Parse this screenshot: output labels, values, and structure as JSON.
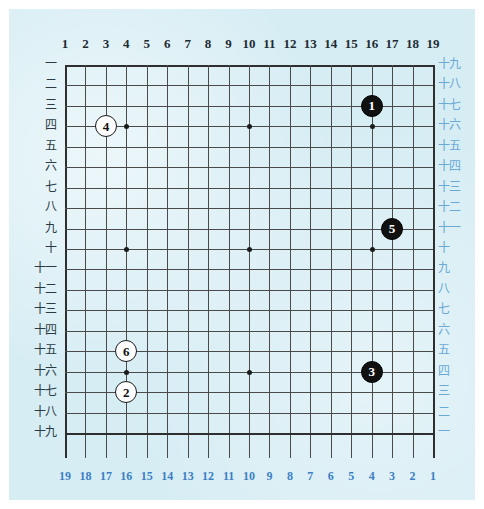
{
  "diagram": {
    "board_size": 19,
    "colors": {
      "paper": "#d6edf4",
      "grid_line": "#4a4a4a",
      "top_label": "#1f2b33",
      "bottom_label": "#3c7fc4",
      "left_label": "#2a3b44",
      "right_label": "#6aa9d4",
      "black_stone": "#111111",
      "white_stone": "#fdfdfd"
    }
  },
  "labels": {
    "top": [
      "1",
      "2",
      "3",
      "4",
      "5",
      "6",
      "7",
      "8",
      "9",
      "10",
      "11",
      "12",
      "13",
      "14",
      "15",
      "16",
      "17",
      "18",
      "19"
    ],
    "bottom": [
      "19",
      "18",
      "17",
      "16",
      "15",
      "14",
      "13",
      "12",
      "11",
      "10",
      "9",
      "8",
      "7",
      "6",
      "5",
      "4",
      "3",
      "2",
      "1"
    ],
    "left": [
      "一",
      "二",
      "三",
      "四",
      "五",
      "六",
      "七",
      "八",
      "九",
      "十",
      "十一",
      "十二",
      "十三",
      "十四",
      "十五",
      "十六",
      "十七",
      "十八",
      "十九"
    ],
    "right": [
      "十九",
      "十八",
      "十七",
      "十六",
      "十五",
      "十四",
      "十三",
      "十二",
      "十一",
      "十",
      "九",
      "八",
      "七",
      "六",
      "五",
      "四",
      "三",
      "二",
      "一"
    ]
  },
  "star_points": [
    {
      "col": 4,
      "row": 4
    },
    {
      "col": 10,
      "row": 4
    },
    {
      "col": 16,
      "row": 4
    },
    {
      "col": 4,
      "row": 10
    },
    {
      "col": 10,
      "row": 10
    },
    {
      "col": 16,
      "row": 10
    },
    {
      "col": 4,
      "row": 16
    },
    {
      "col": 10,
      "row": 16
    },
    {
      "col": 16,
      "row": 16
    }
  ],
  "stones": [
    {
      "number": "1",
      "color": "black",
      "col": 16,
      "row": 3
    },
    {
      "number": "2",
      "color": "white",
      "col": 4,
      "row": 17
    },
    {
      "number": "3",
      "color": "black",
      "col": 16,
      "row": 16
    },
    {
      "number": "4",
      "color": "white",
      "col": 3,
      "row": 4
    },
    {
      "number": "5",
      "color": "black",
      "col": 17,
      "row": 9
    },
    {
      "number": "6",
      "color": "white",
      "col": 4,
      "row": 15
    }
  ]
}
